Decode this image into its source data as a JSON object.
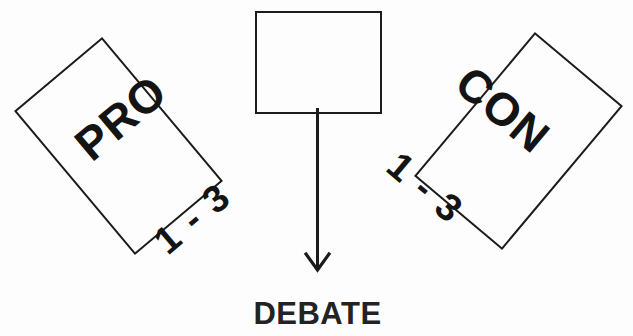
{
  "diagram": {
    "background_color": "#fdfdfd",
    "stroke_color": "#1c1c1c",
    "text_color": "#141414",
    "nodes": {
      "pro": {
        "label": "PRO",
        "count": "1 - 3",
        "rotation_deg": -40,
        "shape": "rectangle"
      },
      "con": {
        "label": "CON",
        "count": "1 - 3",
        "rotation_deg": 40,
        "shape": "rectangle"
      },
      "center": {
        "label": "",
        "rotation_deg": 0,
        "shape": "rectangle"
      }
    },
    "arrow": {
      "direction": "down",
      "head_style": "open-v"
    },
    "caption": "DEBATE"
  }
}
